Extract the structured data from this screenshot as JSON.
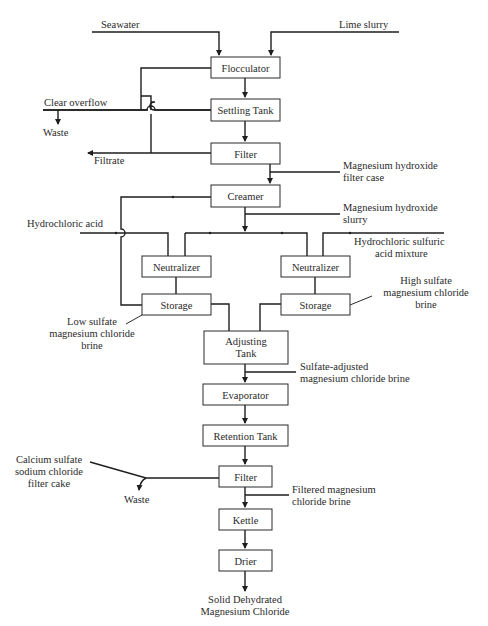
{
  "diagram": {
    "type": "process-flow",
    "colors": {
      "line": "#1e1e1e",
      "box_border": "#2a2a2a",
      "text": "#2a2a2a",
      "background": "#ffffff"
    },
    "units": {
      "flocculator": "Flocculator",
      "settling_tank": "Settling Tank",
      "filter1": "Filter",
      "creamer": "Creamer",
      "neutralizer_left": "Neutralizer",
      "neutralizer_right": "Neutralizer",
      "storage_left": "Storage",
      "storage_right": "Storage",
      "adjusting_tank_line1": "Adjusting",
      "adjusting_tank_line2": "Tank",
      "evaporator": "Evaporator",
      "retention_tank": "Retention Tank",
      "filter2": "Filter",
      "kettle": "Kettle",
      "drier": "Drier"
    },
    "streams": {
      "seawater": "Seawater",
      "lime_slurry": "Lime slurry",
      "clear_overflow": "Clear overflow",
      "waste_top": "Waste",
      "filtrate": "Filtrate",
      "mg_hydroxide_filter_case_1": "Magnesium hydroxide",
      "mg_hydroxide_filter_case_2": "filter case",
      "hydrochloric_acid": "Hydrochloric acid",
      "mg_hydroxide_slurry_1": "Magnesium hydroxide",
      "mg_hydroxide_slurry_2": "slurry",
      "hcl_sulfuric_1": "Hydrochloric sulfuric",
      "hcl_sulfuric_2": "acid mixture",
      "low_sulfate_1": "Low sulfate",
      "low_sulfate_2": "magnesium chloride",
      "low_sulfate_3": "brine",
      "high_sulfate_1": "High sulfate",
      "high_sulfate_2": "magnesium chloride",
      "high_sulfate_3": "brine",
      "sulfate_adjusted_1": "Sulfate-adjusted",
      "sulfate_adjusted_2": "magnesium chloride brine",
      "filter_cake_1": "Calcium sulfate",
      "filter_cake_2": "sodium chloride",
      "filter_cake_3": "filter cake",
      "waste_bottom": "Waste",
      "filtered_brine_1": "Filtered magnesium",
      "filtered_brine_2": "chloride brine",
      "product_1": "Solid Dehydrated",
      "product_2": "Magnesium Chloride"
    },
    "edges": [
      [
        "seawater",
        "flocculator"
      ],
      [
        "lime_slurry",
        "flocculator"
      ],
      [
        "flocculator",
        "settling_tank"
      ],
      [
        "settling_tank",
        "filter1"
      ],
      [
        "settling_tank",
        "clear_overflow"
      ],
      [
        "clear_overflow",
        "waste_top"
      ],
      [
        "clear_overflow",
        "flocculator"
      ],
      [
        "filter1",
        "filtrate"
      ],
      [
        "filtrate",
        "settling_tank"
      ],
      [
        "filter1",
        "creamer"
      ],
      [
        "mg_hydroxide_filter_case",
        "creamer"
      ],
      [
        "creamer",
        "storage_left"
      ],
      [
        "creamer",
        "mg_hydroxide_slurry"
      ],
      [
        "mg_hydroxide_slurry",
        "neutralizer_left"
      ],
      [
        "mg_hydroxide_slurry",
        "neutralizer_right"
      ],
      [
        "hydrochloric_acid",
        "neutralizer_left"
      ],
      [
        "hcl_sulfuric_acid_mixture",
        "neutralizer_right"
      ],
      [
        "neutralizer_left",
        "storage_left"
      ],
      [
        "neutralizer_right",
        "storage_right"
      ],
      [
        "storage_left",
        "adjusting_tank"
      ],
      [
        "storage_right",
        "adjusting_tank"
      ],
      [
        "adjusting_tank",
        "evaporator"
      ],
      [
        "evaporator",
        "retention_tank"
      ],
      [
        "retention_tank",
        "filter2"
      ],
      [
        "filter2",
        "filter_cake"
      ],
      [
        "filter_cake",
        "waste_bottom"
      ],
      [
        "filter2",
        "kettle"
      ],
      [
        "kettle",
        "drier"
      ],
      [
        "drier",
        "product"
      ]
    ]
  }
}
